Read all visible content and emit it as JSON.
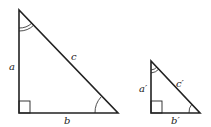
{
  "diagram": {
    "type": "similar right triangles",
    "large_triangle": {
      "labels": {
        "a": "a",
        "b": "b",
        "c": "c"
      }
    },
    "small_triangle": {
      "labels": {
        "a": "a′",
        "b": "b′",
        "c": "c′"
      }
    },
    "colors": {
      "stroke": "#222222",
      "background": "#ffffff"
    }
  }
}
